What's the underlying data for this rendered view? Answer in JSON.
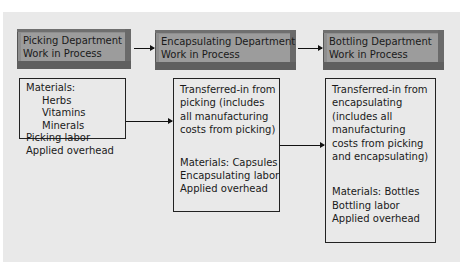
{
  "departments": [
    {
      "title_lines": [
        "Picking Department",
        "Work in Process"
      ],
      "items": [
        {
          "text": "Materials:",
          "indent": false
        },
        {
          "text": "Herbs",
          "indent": true
        },
        {
          "text": "Vitamins",
          "indent": true
        },
        {
          "text": "Minerals",
          "indent": true
        },
        {
          "text": "Picking labor",
          "indent": false
        },
        {
          "text": "Applied overhead",
          "indent": false
        }
      ]
    },
    {
      "title_lines": [
        "Encapsulating Department",
        "Work in Process"
      ],
      "transferred_in": [
        "Transferred-in from",
        "picking (includes",
        "all manufacturing",
        "costs from picking)"
      ],
      "items": [
        "Materials: Capsules",
        "Encapsulating labor",
        "Applied overhead"
      ]
    },
    {
      "title_lines": [
        "Bottling Department",
        "Work in Process"
      ],
      "transferred_in": [
        "Transferred-in from",
        "encapsulating",
        "(includes all",
        "manufacturing",
        "costs from picking",
        "and encapsulating)"
      ],
      "items": [
        "Materials: Bottles",
        "Bottling labor",
        "Applied overhead"
      ]
    }
  ],
  "colors": {
    "background_panel": "#e9e9e9",
    "header_fill": "#9c9c9c",
    "header_shadow": "#5f5f5f",
    "line": "#111111"
  }
}
